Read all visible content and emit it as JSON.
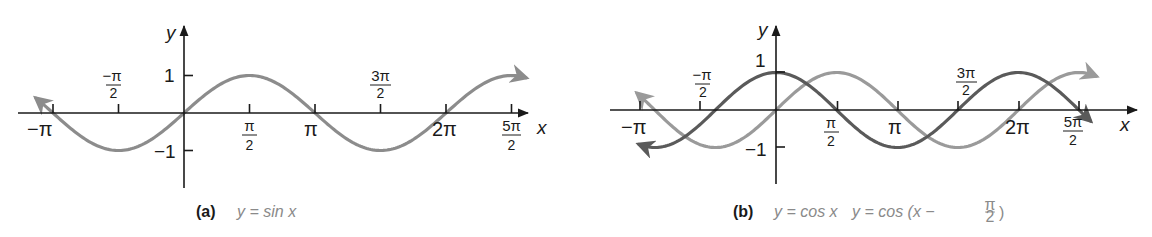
{
  "chart_data": [
    {
      "type": "line",
      "panel": "a",
      "caption_label": "(a)",
      "caption_equation": "y = sin x",
      "title": "",
      "xlabel": "x",
      "ylabel": "y",
      "x_tick_labels": [
        "−π",
        "−π/2",
        "π/2",
        "π",
        "3π/2",
        "2π",
        "5π/2"
      ],
      "x_tick_values": [
        -3.1416,
        -1.5708,
        1.5708,
        3.1416,
        4.7124,
        6.2832,
        7.854
      ],
      "y_tick_labels": [
        "1",
        "−1"
      ],
      "y_tick_values": [
        1,
        -1
      ],
      "xlim": [
        -3.6,
        8.3
      ],
      "ylim": [
        -1.9,
        1.9
      ],
      "grid": false,
      "legend": null,
      "series": [
        {
          "name": "y = sin x",
          "color": "#8c8c8c",
          "function": "sin(x)",
          "x": [
            -3.6,
            -3.1416,
            -1.5708,
            0,
            1.5708,
            3.1416,
            4.7124,
            6.2832,
            7.854,
            8.3
          ],
          "y": [
            0.44,
            0,
            -1,
            0,
            1,
            0,
            -1,
            0,
            1,
            0.9
          ],
          "arrows_at_ends": true
        }
      ]
    },
    {
      "type": "line",
      "panel": "b",
      "caption_label": "(b)",
      "caption_equation_1": "y = cos x",
      "caption_equation_2": "y = cos (x − π/2)",
      "title": "",
      "xlabel": "x",
      "ylabel": "y",
      "x_tick_labels": [
        "−π",
        "−π/2",
        "π/2",
        "π",
        "3π/2",
        "2π",
        "5π/2"
      ],
      "x_tick_values": [
        -3.1416,
        -1.5708,
        1.5708,
        3.1416,
        4.7124,
        6.2832,
        7.854
      ],
      "y_tick_labels": [
        "1",
        "−1"
      ],
      "y_tick_values": [
        1,
        -1
      ],
      "xlim": [
        -3.6,
        8.3
      ],
      "ylim": [
        -1.9,
        1.9
      ],
      "grid": false,
      "legend": null,
      "series": [
        {
          "name": "y = cos x",
          "color": "#5a5a5a",
          "function": "cos(x)",
          "x": [
            -3.6,
            -3.1416,
            -1.5708,
            0,
            1.5708,
            3.1416,
            4.7124,
            6.2832,
            7.854,
            8.3
          ],
          "y": [
            -0.9,
            -1,
            0,
            1,
            0,
            -1,
            0,
            1,
            0,
            -0.44
          ],
          "arrows_at_ends": true
        },
        {
          "name": "y = cos (x − π/2)",
          "color": "#9a9a9a",
          "function": "cos(x - pi/2)",
          "x": [
            -3.6,
            -3.1416,
            -1.5708,
            0,
            1.5708,
            3.1416,
            4.7124,
            6.2832,
            7.854,
            8.3
          ],
          "y": [
            0.44,
            0,
            -1,
            0,
            1,
            0,
            -1,
            0,
            1,
            0.9
          ],
          "arrows_at_ends": true
        }
      ]
    }
  ],
  "panels": {
    "a": {
      "caption_label": "(a)",
      "caption_eq": "y = sin x",
      "x_axis_label": "x",
      "y_axis_label": "y",
      "ticks": {
        "neg_pi": "−π",
        "neg_pi_over_2_num": "−π",
        "neg_pi_over_2_den": "2",
        "pi_over_2_num": "π",
        "pi_over_2_den": "2",
        "pi": "π",
        "three_pi_over_2_num": "3π",
        "three_pi_over_2_den": "2",
        "two_pi": "2π",
        "five_pi_over_2_num": "5π",
        "five_pi_over_2_den": "2",
        "y_one": "1",
        "y_neg_one": "−1"
      }
    },
    "b": {
      "caption_label": "(b)",
      "caption_eq1": "y = cos x",
      "caption_eq2_prefix": "y = cos (x −",
      "caption_eq2_num": "π",
      "caption_eq2_den": "2",
      "caption_eq2_suffix": ")",
      "x_axis_label": "x",
      "y_axis_label": "y",
      "ticks": {
        "neg_pi": "−π",
        "neg_pi_over_2_num": "−π",
        "neg_pi_over_2_den": "2",
        "pi_over_2_num": "π",
        "pi_over_2_den": "2",
        "pi": "π",
        "three_pi_over_2_num": "3π",
        "three_pi_over_2_den": "2",
        "two_pi": "2π",
        "five_pi_over_2_num": "5π",
        "five_pi_over_2_den": "2",
        "y_one": "1",
        "y_neg_one": "−1"
      }
    }
  }
}
